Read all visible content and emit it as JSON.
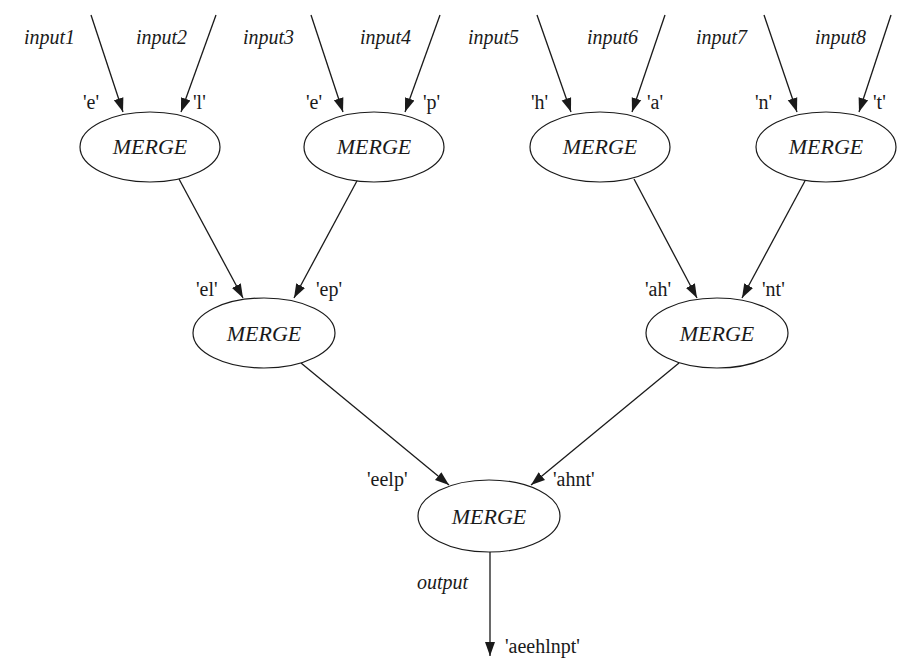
{
  "diagram": {
    "type": "merge-tree",
    "node_label": "MERGE",
    "inputs": [
      {
        "name": "input1",
        "value": "'e'"
      },
      {
        "name": "input2",
        "value": "'l'"
      },
      {
        "name": "input3",
        "value": "'e'"
      },
      {
        "name": "input4",
        "value": "'p'"
      },
      {
        "name": "input5",
        "value": "'h'"
      },
      {
        "name": "input6",
        "value": "'a'"
      },
      {
        "name": "input7",
        "value": "'n'"
      },
      {
        "name": "input8",
        "value": "'t'"
      }
    ],
    "level1_nodes": [
      {
        "label": "MERGE"
      },
      {
        "label": "MERGE"
      },
      {
        "label": "MERGE"
      },
      {
        "label": "MERGE"
      }
    ],
    "level1_outputs": [
      "'el'",
      "'ep'",
      "'ah'",
      "'nt'"
    ],
    "level2_nodes": [
      {
        "label": "MERGE"
      },
      {
        "label": "MERGE"
      }
    ],
    "level2_outputs": [
      "'eelp'",
      "'ahnt'"
    ],
    "root_node": {
      "label": "MERGE"
    },
    "output": {
      "name": "output",
      "value": "'aeehlnpt'"
    }
  }
}
